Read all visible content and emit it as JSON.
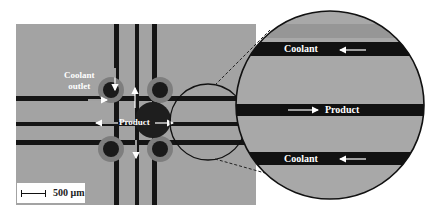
{
  "figure": {
    "left_panel": {
      "labels": {
        "coolant_outlet": "Coolant\noutlet",
        "product": "Product"
      },
      "scale_bar": {
        "label": "500 μm"
      }
    },
    "magnified_panel": {
      "labels": {
        "coolant_top": "Coolant",
        "product": "Product",
        "coolant_bottom": "Coolant"
      },
      "flow_directions": {
        "coolant": "left",
        "product": "right"
      }
    }
  }
}
